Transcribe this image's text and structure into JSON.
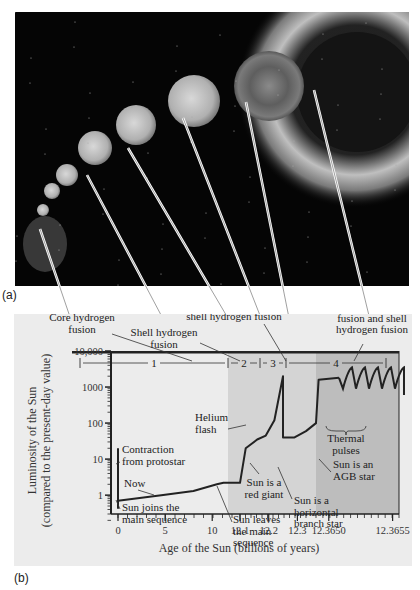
{
  "figure": {
    "panel_a_label": "(a)",
    "panel_b_label": "(b)",
    "photo_description": "Sequence of images of the Sun growing from main-sequence star to red giant, ending in a planetary nebula",
    "colors": {
      "panel_bg": "#ececec",
      "shade_light": "#d4d4d4",
      "shade_dark": "#bdbdbd",
      "curve": "#222222",
      "photo_bg": "#050505"
    }
  },
  "chart_data": {
    "type": "line",
    "title": "",
    "xlabel": "Age of the Sun (billions of years)",
    "ylabel": "Luminosity of the Sun",
    "ylabel2": "(compared to the present-day value)",
    "yscale": "log",
    "ylim": [
      0.3,
      10000
    ],
    "yticks": [
      "1",
      "10",
      "100",
      "1000",
      "10,000"
    ],
    "ytick_values": [
      1,
      10,
      100,
      1000,
      10000
    ],
    "x_segments": [
      {
        "range": [
          0,
          12.1
        ],
        "ticks": [
          "0",
          "5",
          "10"
        ],
        "tick_values": [
          0,
          5,
          10
        ]
      },
      {
        "range": [
          12.1,
          12.33
        ],
        "ticks": [
          "12.1",
          "12.2",
          "12.3"
        ],
        "tick_values": [
          12.1,
          12.2,
          12.3
        ]
      },
      {
        "range": [
          12.3649,
          12.36555
        ],
        "ticks": [
          "12.3650",
          "12.3655"
        ],
        "tick_values": [
          12.365,
          12.3655
        ]
      }
    ],
    "phases": [
      {
        "number": "1",
        "name": "Core hydrogen fusion"
      },
      {
        "number": "2",
        "name": "Shell hydrogen fusion"
      },
      {
        "number": "3",
        "name": "Core helium fusion and shell hydrogen fusion"
      },
      {
        "number": "4",
        "name": "Shell helium fusion and shell hydrogen fusion"
      }
    ],
    "series": [
      {
        "name": "Solar luminosity",
        "points": [
          {
            "seg": 0,
            "x": 0,
            "y": 0.7
          },
          {
            "seg": 0,
            "x": 4.6,
            "y": 1.0
          },
          {
            "seg": 0,
            "x": 8,
            "y": 1.3
          },
          {
            "seg": 0,
            "x": 10.5,
            "y": 2.0
          },
          {
            "seg": 0,
            "x": 11.2,
            "y": 2.2
          },
          {
            "seg": 1,
            "x": 12.1,
            "y": 2.2
          },
          {
            "seg": 1,
            "x": 12.12,
            "y": 20
          },
          {
            "seg": 1,
            "x": 12.16,
            "y": 35
          },
          {
            "seg": 1,
            "x": 12.19,
            "y": 45
          },
          {
            "seg": 1,
            "x": 12.22,
            "y": 120
          },
          {
            "seg": 1,
            "x": 12.25,
            "y": 2000
          },
          {
            "seg": 1,
            "x": 12.25,
            "y": 40
          },
          {
            "seg": 1,
            "x": 12.29,
            "y": 40
          },
          {
            "seg": 1,
            "x": 12.33,
            "y": 60
          },
          {
            "seg": 2,
            "x": 12.3649,
            "y": 100
          },
          {
            "seg": 2,
            "x": 12.36492,
            "y": 1600
          },
          {
            "seg": 2,
            "x": 12.36508,
            "y": 1800
          }
        ],
        "contraction": {
          "x": 0,
          "y_from": 0.7,
          "y_to": 20
        },
        "thermal_pulse_count": 5
      }
    ],
    "annotations": [
      {
        "id": "contraction",
        "text": [
          "Contraction",
          "from protostar"
        ]
      },
      {
        "id": "now",
        "text": [
          "Now"
        ]
      },
      {
        "id": "joins-ms",
        "text": [
          "Sun joins the",
          "main sequence"
        ]
      },
      {
        "id": "leaves-ms",
        "text": [
          "Sun leaves",
          "the main",
          "sequence"
        ]
      },
      {
        "id": "red-giant",
        "text": [
          "Sun is a",
          "red giant"
        ]
      },
      {
        "id": "helium-flash",
        "text": [
          "Helium",
          "flash"
        ]
      },
      {
        "id": "horizontal-branch",
        "text": [
          "Sun is a",
          "horizontal",
          "branch star"
        ]
      },
      {
        "id": "agb",
        "text": [
          "Sun is an",
          "AGB star"
        ]
      },
      {
        "id": "thermal-pulses",
        "text": [
          "Thermal",
          "pulses"
        ]
      }
    ],
    "grid": false,
    "legend": "none"
  }
}
